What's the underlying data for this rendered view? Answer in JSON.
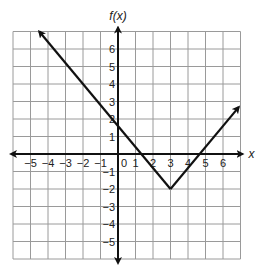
{
  "chart_data": {
    "type": "line",
    "title": "",
    "xlabel": "x",
    "ylabel": "f(x)",
    "xlim": [
      -6,
      7
    ],
    "ylim": [
      -6,
      7
    ],
    "grid": true,
    "legend": null,
    "x_ticks": [
      "-5",
      "-4",
      "-3",
      "-2",
      "-1",
      "0",
      "1",
      "2",
      "3",
      "4",
      "5",
      "6"
    ],
    "y_ticks": [
      "6",
      "5",
      "4",
      "3",
      "2",
      "1",
      "-1",
      "-2",
      "-3",
      "-4",
      "-5"
    ],
    "series": [
      {
        "name": "f(x)",
        "description": "Absolute-value-shaped graph with vertex at (3, -2), arrows at both ends",
        "x": [
          -4.5,
          1.33,
          3,
          4.67,
          6.9
        ],
        "y": [
          7,
          0,
          -2,
          0,
          2.68
        ],
        "vertex": [
          3,
          -2
        ],
        "x_intercepts": [
          1.33,
          4.67
        ],
        "y_intercept": 1.6
      }
    ]
  },
  "labels": {
    "y_axis": "f(x)",
    "x_axis": "x"
  },
  "colors": {
    "grid": "#9a9a9a",
    "axis": "#111111",
    "line": "#111111"
  }
}
